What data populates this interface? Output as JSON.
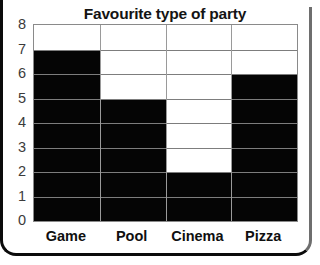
{
  "chart_data": {
    "type": "bar",
    "title": "Favourite type of party",
    "xlabel": "",
    "ylabel": "",
    "categories": [
      "Game",
      "Pool",
      "Cinema",
      "Pizza"
    ],
    "values": [
      7,
      5,
      2,
      6
    ],
    "ylim": [
      0,
      8
    ],
    "ytick_step": 1,
    "ytick_labels": [
      "0",
      "1",
      "2",
      "3",
      "4",
      "5",
      "6",
      "7",
      "8"
    ],
    "grid": true,
    "grid_orientation": "both",
    "legend": false,
    "legend_position": "none",
    "bar_color": "#050505",
    "grid_color": "#7d7d7d",
    "frame_color": "#8a8a8a",
    "title_color": "#141414",
    "label_color": "#101010",
    "bars_touching": true,
    "series": [
      {
        "name": "Number of children",
        "values": [
          7,
          5,
          2,
          6
        ]
      }
    ]
  }
}
